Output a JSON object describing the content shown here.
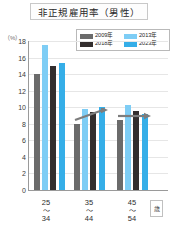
{
  "chart_data": {
    "type": "bar",
    "title": "非正規雇用率（男性）",
    "xlabel": "歳",
    "ylabel": "（%）",
    "ylim": [
      0,
      18
    ],
    "ytick_step": 2,
    "yticks": [
      18,
      16,
      14,
      12,
      10,
      8,
      6,
      4,
      2,
      0
    ],
    "grid": true,
    "legend_position": "top-right",
    "categories": [
      "25〜34",
      "35〜44",
      "45〜54"
    ],
    "category_parts": [
      {
        "top": "25",
        "tilde": "〜",
        "bottom": "34"
      },
      {
        "top": "35",
        "tilde": "〜",
        "bottom": "44"
      },
      {
        "top": "45",
        "tilde": "〜",
        "bottom": "54"
      }
    ],
    "series": [
      {
        "name": "2009年",
        "color": "#6b6b6b",
        "values": [
          14.0,
          8.0,
          8.4
        ]
      },
      {
        "name": "2013年",
        "color": "#7ecdf5",
        "values": [
          17.5,
          9.8,
          10.3
        ]
      },
      {
        "name": "2018年",
        "color": "#332e2e",
        "values": [
          15.0,
          9.4,
          9.6
        ]
      },
      {
        "name": "2023年",
        "color": "#35aee8",
        "values": [
          15.3,
          10.0,
          9.2
        ]
      }
    ],
    "annotations": [
      {
        "name": "trend-arrow-35-44",
        "type": "arrow",
        "direction": "up-right"
      },
      {
        "name": "trend-arrow-45-54",
        "type": "arrow",
        "direction": "right"
      }
    ]
  },
  "unit_box": {
    "label": "歳"
  },
  "axis": {
    "percent_label": "（%）"
  }
}
